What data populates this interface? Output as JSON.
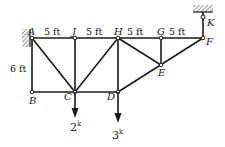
{
  "diagram": {
    "type": "truss",
    "nodes": {
      "A": {
        "label": "A",
        "x": 32,
        "y": 38
      },
      "J": {
        "label": "J",
        "x": 75,
        "y": 38
      },
      "H": {
        "label": "H",
        "x": 118,
        "y": 38
      },
      "G": {
        "label": "G",
        "x": 161,
        "y": 38
      },
      "F": {
        "label": "F",
        "x": 203,
        "y": 38
      },
      "K": {
        "label": "K",
        "x": 203,
        "y": 19
      },
      "B": {
        "label": "B",
        "x": 32,
        "y": 92
      },
      "C": {
        "label": "C",
        "x": 75,
        "y": 92
      },
      "D": {
        "label": "D",
        "x": 118,
        "y": 92
      },
      "E": {
        "label": "E",
        "x": 161,
        "y": 65
      }
    },
    "dimensions": {
      "AJ": "5 ft",
      "JH": "5 ft",
      "HG": "5 ft",
      "GF": "5 ft",
      "AB": "6 ft"
    },
    "loads": {
      "C": {
        "value": "2",
        "unit": "k"
      },
      "D": {
        "value": "3",
        "unit": "k"
      }
    },
    "supports": {
      "A": "fixed wall (left)",
      "K": "ceiling hanger"
    }
  }
}
